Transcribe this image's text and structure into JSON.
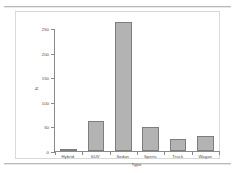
{
  "chart_data": {
    "type": "bar",
    "title": "",
    "xlabel": "Type",
    "ylabel": "N",
    "categories": [
      "Hybrid",
      "SUV",
      "Sedan",
      "Sports",
      "Truck",
      "Wagon"
    ],
    "values": [
      3,
      60,
      262,
      49,
      24,
      30
    ],
    "ylim": [
      0,
      250
    ],
    "yticks": [
      0,
      50,
      100,
      150,
      200,
      250
    ],
    "ytick_labels": [
      "0",
      "50",
      "100",
      "150",
      "200",
      "250"
    ],
    "grid": false,
    "legend": null,
    "bar_fill_color": "#b3b3b3",
    "bar_border_color": "#7d7d7d",
    "axis_color": "#8a8a8a",
    "text_color": "#4a4a4a",
    "background_color": "#ffffff"
  },
  "frame": {
    "rule_top": "",
    "rule_bottom": ""
  }
}
